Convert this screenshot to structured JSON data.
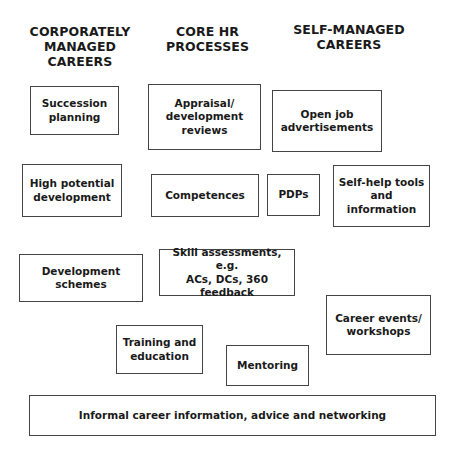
{
  "headers": {
    "corporate": "CORPORATELY\nMANAGED\nCAREERS",
    "core": "CORE HR\nPROCESSES",
    "self": "SELF-MANAGED\nCAREERS"
  },
  "boxes": {
    "succession": "Succession\nplanning",
    "appraisal": "Appraisal/\ndevelopment\nreviews",
    "open_job": "Open job\nadvertisements",
    "high_potential": "High potential\ndevelopment",
    "competences": "Competences",
    "pdps": "PDPs",
    "self_help": "Self-help tools\nand\ninformation",
    "dev_schemes": "Development  schemes",
    "skill_assess": "Skill assessments,  e.g.\nACs, DCs, 360 feedback",
    "training": "Training and\neducation",
    "mentoring": "Mentoring",
    "career_events": "Career events/\nworkshops",
    "informal": "Informal career information, advice and networking"
  }
}
